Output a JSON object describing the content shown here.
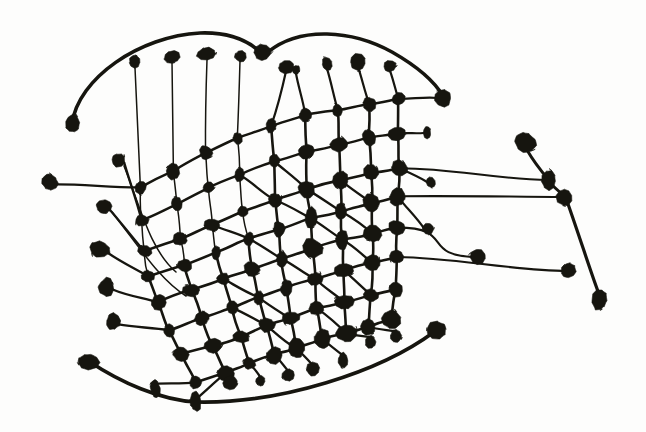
{
  "figure": {
    "kind": "node-link-graph",
    "medium": "ink-drawing",
    "canvas": {
      "width": 646,
      "height": 432
    },
    "colors": {
      "background": "#fdfdfc",
      "ink": "#16150f"
    },
    "counts": {
      "nodes": 168,
      "edges": 214
    },
    "stroke": {
      "lattice_width": 2.6,
      "thin_width": 1.5,
      "arc_width": 3.4
    },
    "node_radius": {
      "small": 4.2,
      "medium": 5.6,
      "large": 7.6,
      "xlarge": 10.5
    },
    "structure_notes": {
      "lattice": "irregular quadrilateral mesh of ~9 curved columns by ~8 curved rows occupying the centre",
      "pendants": "stalked blob terminals radiating left, up, right and down from the mesh border",
      "arcs": "three long free-hand arcs: two over the top, one sweeping beneath the mesh",
      "right_chain": "a diagonal chain of four large blobs on the far right joined by four long horizontal leads"
    },
    "geometry": {
      "columns": [
        {
          "id": "c0",
          "x_top": 141,
          "x_bottom": 196,
          "curve": 28
        },
        {
          "id": "c1",
          "x_top": 176,
          "x_bottom": 226,
          "curve": 22
        },
        {
          "id": "c2",
          "x_top": 210,
          "x_bottom": 252,
          "curve": 16
        },
        {
          "id": "c3",
          "x_top": 243,
          "x_bottom": 276,
          "curve": 10
        },
        {
          "id": "c4",
          "x_top": 277,
          "x_bottom": 300,
          "curve": 6
        },
        {
          "id": "c5",
          "x_top": 311,
          "x_bottom": 324,
          "curve": 2
        },
        {
          "id": "c6",
          "x_top": 345,
          "x_bottom": 349,
          "curve": -2
        },
        {
          "id": "c7",
          "x_top": 377,
          "x_bottom": 374,
          "curve": -5
        },
        {
          "id": "c8",
          "x_top": 406,
          "x_bottom": 398,
          "curve": -8
        }
      ],
      "rows": [
        {
          "id": "r0",
          "y_left": 188,
          "y_right": 100,
          "curve": -18
        },
        {
          "id": "r1",
          "y_left": 220,
          "y_right": 132,
          "curve": -14
        },
        {
          "id": "r2",
          "y_left": 252,
          "y_right": 168,
          "curve": -11
        },
        {
          "id": "r3",
          "y_left": 276,
          "y_right": 196,
          "curve": -9
        },
        {
          "id": "r4",
          "y_left": 300,
          "y_right": 226,
          "curve": -7
        },
        {
          "id": "r5",
          "y_left": 324,
          "y_right": 258,
          "curve": -6
        },
        {
          "id": "r6",
          "y_left": 348,
          "y_right": 290,
          "curve": -5
        },
        {
          "id": "r7",
          "y_left": 372,
          "y_right": 322,
          "curve": -4
        }
      ]
    },
    "legend": {
      "node_label": "blob node",
      "edge_label": "ink edge",
      "visible": false
    }
  },
  "nodes": [
    {
      "id": "tp0",
      "x": 135,
      "y": 62,
      "r": 8.2,
      "group": "top-pendant"
    },
    {
      "id": "tp1",
      "x": 172,
      "y": 57,
      "r": 8.6,
      "group": "top-pendant"
    },
    {
      "id": "tp2",
      "x": 207,
      "y": 54,
      "r": 8.4,
      "group": "top-pendant"
    },
    {
      "id": "tp3",
      "x": 240,
      "y": 56,
      "r": 6.6,
      "group": "top-pendant"
    },
    {
      "id": "tp4",
      "x": 263,
      "y": 52,
      "r": 7.4,
      "group": "top-pendant"
    },
    {
      "id": "tp5",
      "x": 286,
      "y": 67,
      "r": 6.0,
      "group": "top-pendant"
    },
    {
      "id": "tp6",
      "x": 296,
      "y": 70,
      "r": 5.0,
      "group": "top-pendant"
    },
    {
      "id": "tp7",
      "x": 327,
      "y": 64,
      "r": 6.6,
      "group": "top-pendant"
    },
    {
      "id": "tp8",
      "x": 358,
      "y": 62,
      "r": 7.0,
      "group": "top-pendant"
    },
    {
      "id": "tp9",
      "x": 390,
      "y": 66,
      "r": 6.6,
      "group": "top-pendant"
    },
    {
      "id": "lp0",
      "x": 72,
      "y": 124,
      "r": 9.4,
      "group": "arc-terminal"
    },
    {
      "id": "lp1",
      "x": 50,
      "y": 182,
      "r": 8.0,
      "group": "left-pendant"
    },
    {
      "id": "lp2",
      "x": 118,
      "y": 160,
      "r": 8.8,
      "group": "left-pendant"
    },
    {
      "id": "lp3",
      "x": 104,
      "y": 207,
      "r": 8.0,
      "group": "left-pendant"
    },
    {
      "id": "lp4",
      "x": 100,
      "y": 249,
      "r": 8.4,
      "group": "left-pendant"
    },
    {
      "id": "lp5",
      "x": 107,
      "y": 287,
      "r": 8.2,
      "group": "left-pendant"
    },
    {
      "id": "lp6",
      "x": 113,
      "y": 322,
      "r": 8.0,
      "group": "left-pendant"
    },
    {
      "id": "lp7",
      "x": 88,
      "y": 361,
      "r": 9.0,
      "group": "arc-terminal"
    },
    {
      "id": "rp0",
      "x": 443,
      "y": 98,
      "r": 7.8,
      "group": "right-pendant"
    },
    {
      "id": "rp1",
      "x": 427,
      "y": 133,
      "r": 5.0,
      "group": "right-pendant"
    },
    {
      "id": "rp2",
      "x": 431,
      "y": 182,
      "r": 5.6,
      "group": "right-pendant"
    },
    {
      "id": "rp3",
      "x": 428,
      "y": 229,
      "r": 5.2,
      "group": "right-pendant"
    },
    {
      "id": "rp4",
      "x": 437,
      "y": 330,
      "r": 11.0,
      "group": "arc-terminal"
    },
    {
      "id": "rc0",
      "x": 525,
      "y": 142,
      "r": 12.0,
      "group": "right-chain"
    },
    {
      "id": "rc1",
      "x": 549,
      "y": 180,
      "r": 8.2,
      "group": "right-chain"
    },
    {
      "id": "rc2",
      "x": 565,
      "y": 197,
      "r": 9.0,
      "group": "right-chain"
    },
    {
      "id": "rc3",
      "x": 600,
      "y": 300,
      "r": 10.0,
      "group": "right-chain"
    },
    {
      "id": "rl0",
      "x": 478,
      "y": 257,
      "r": 7.2,
      "group": "right-lead"
    },
    {
      "id": "rl1",
      "x": 568,
      "y": 271,
      "r": 8.0,
      "group": "right-lead"
    },
    {
      "id": "bp0",
      "x": 155,
      "y": 389,
      "r": 7.6,
      "group": "bottom-pendant"
    },
    {
      "id": "bp1",
      "x": 195,
      "y": 402,
      "r": 9.0,
      "group": "arc-waypoint"
    },
    {
      "id": "bp2",
      "x": 231,
      "y": 383,
      "r": 6.4,
      "group": "bottom-pendant"
    },
    {
      "id": "bp3",
      "x": 260,
      "y": 381,
      "r": 6.4,
      "group": "bottom-pendant"
    },
    {
      "id": "bp4",
      "x": 288,
      "y": 375,
      "r": 6.2,
      "group": "bottom-pendant"
    },
    {
      "id": "bp5",
      "x": 313,
      "y": 370,
      "r": 6.4,
      "group": "bottom-pendant"
    },
    {
      "id": "bp6",
      "x": 343,
      "y": 360,
      "r": 6.6,
      "group": "bottom-pendant"
    },
    {
      "id": "bp7",
      "x": 371,
      "y": 342,
      "r": 6.8,
      "group": "bottom-pendant"
    },
    {
      "id": "bp8",
      "x": 396,
      "y": 336,
      "r": 6.6,
      "group": "bottom-pendant"
    }
  ],
  "arcs": [
    {
      "id": "arc-top-left",
      "from": "lp0",
      "to": "tp4",
      "path": "M72,124 C78,78 140,36 200,33 C228,32 246,40 258,50",
      "width": 3.6
    },
    {
      "id": "arc-top-right",
      "from": "tp4",
      "to": "rp0",
      "path": "M268,52 C300,26 352,30 392,52 C420,68 436,84 443,96",
      "width": 3.6
    },
    {
      "id": "arc-bottom",
      "from": "lp7",
      "to": "rp4",
      "path": "M90,362 C120,382 160,400 196,402 C280,404 380,372 434,332",
      "width": 3.6
    }
  ]
}
